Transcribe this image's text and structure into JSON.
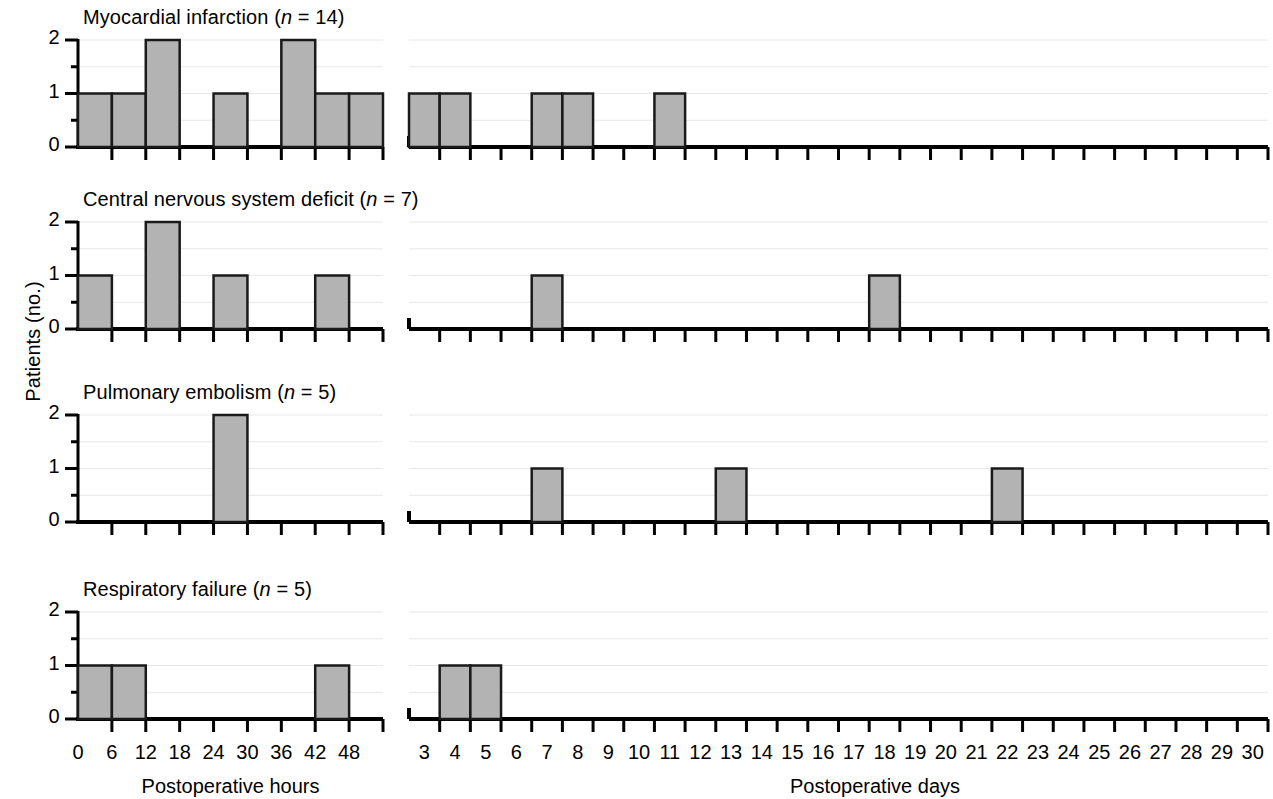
{
  "figure": {
    "ylabel": "Patients (no.)",
    "xlabel_left": "Postoperative hours",
    "xlabel_right": "Postoperative days",
    "bar_fill": "#b3b3b3",
    "bar_stroke": "#1a1a1a",
    "axis_color": "#000000",
    "grid_color": "#e8e8e8",
    "y_ticklabels": [
      "0",
      "1",
      "2"
    ],
    "hours_ticklabels": [
      "0",
      "6",
      "12",
      "18",
      "24",
      "30",
      "36",
      "42",
      "48"
    ],
    "days_ticklabels": [
      "3",
      "4",
      "5",
      "6",
      "7",
      "8",
      "9",
      "10",
      "11",
      "12",
      "13",
      "14",
      "15",
      "16",
      "17",
      "18",
      "19",
      "20",
      "21",
      "22",
      "23",
      "24",
      "25",
      "26",
      "27",
      "28",
      "29",
      "30"
    ]
  },
  "chart_data": {
    "type": "bar",
    "title": "",
    "ylabel": "Patients (no.)",
    "ylim": [
      0,
      2
    ],
    "yticks": [
      0,
      1,
      2
    ],
    "grid": true,
    "legend": "none",
    "layout": "4 stacked panels, each with a left histogram (postoperative hours) and a right histogram (postoperative days)",
    "panels": [
      {
        "title": "Myocardial infarction (n = 14)",
        "title_text": "Myocardial infarction",
        "n": 14,
        "hours": {
          "xlabel": "Postoperative hours",
          "bin_width": 6,
          "xlim": [
            0,
            54
          ],
          "xticks": [
            0,
            6,
            12,
            18,
            24,
            30,
            36,
            42,
            48
          ],
          "bins": [
            "0-6",
            "6-12",
            "12-18",
            "18-24",
            "24-30",
            "30-36",
            "36-42",
            "42-48",
            "48-54"
          ],
          "values": [
            1,
            1,
            2,
            0,
            1,
            0,
            2,
            1,
            1
          ]
        },
        "days": {
          "xlabel": "Postoperative days",
          "bin_width": 1,
          "xlim": [
            3,
            31
          ],
          "categories": [
            3,
            4,
            5,
            6,
            7,
            8,
            9,
            10,
            11,
            12,
            13,
            14,
            15,
            16,
            17,
            18,
            19,
            20,
            21,
            22,
            23,
            24,
            25,
            26,
            27,
            28,
            29,
            30
          ],
          "values": [
            1,
            1,
            0,
            0,
            1,
            1,
            0,
            0,
            1,
            0,
            0,
            0,
            0,
            0,
            0,
            0,
            0,
            0,
            0,
            0,
            0,
            0,
            0,
            0,
            0,
            0,
            0,
            0
          ]
        }
      },
      {
        "title": "Central nervous system deficit (n = 7)",
        "title_text": "Central nervous system deficit",
        "n": 7,
        "hours": {
          "xlabel": "Postoperative hours",
          "bin_width": 6,
          "xlim": [
            0,
            54
          ],
          "xticks": [
            0,
            6,
            12,
            18,
            24,
            30,
            36,
            42,
            48
          ],
          "bins": [
            "0-6",
            "6-12",
            "12-18",
            "18-24",
            "24-30",
            "30-36",
            "36-42",
            "42-48",
            "48-54"
          ],
          "values": [
            1,
            0,
            2,
            0,
            1,
            0,
            0,
            1,
            0
          ]
        },
        "days": {
          "xlabel": "Postoperative days",
          "bin_width": 1,
          "xlim": [
            3,
            31
          ],
          "categories": [
            3,
            4,
            5,
            6,
            7,
            8,
            9,
            10,
            11,
            12,
            13,
            14,
            15,
            16,
            17,
            18,
            19,
            20,
            21,
            22,
            23,
            24,
            25,
            26,
            27,
            28,
            29,
            30
          ],
          "values": [
            0,
            0,
            0,
            0,
            1,
            0,
            0,
            0,
            0,
            0,
            0,
            0,
            0,
            0,
            0,
            1,
            0,
            0,
            0,
            0,
            0,
            0,
            0,
            0,
            0,
            0,
            0,
            0
          ]
        }
      },
      {
        "title": "Pulmonary embolism (n = 5)",
        "title_text": "Pulmonary embolism",
        "n": 5,
        "hours": {
          "xlabel": "Postoperative hours",
          "bin_width": 6,
          "xlim": [
            0,
            54
          ],
          "xticks": [
            0,
            6,
            12,
            18,
            24,
            30,
            36,
            42,
            48
          ],
          "bins": [
            "0-6",
            "6-12",
            "12-18",
            "18-24",
            "24-30",
            "30-36",
            "36-42",
            "42-48",
            "48-54"
          ],
          "values": [
            0,
            0,
            0,
            0,
            2,
            0,
            0,
            0,
            0
          ]
        },
        "days": {
          "xlabel": "Postoperative days",
          "bin_width": 1,
          "xlim": [
            3,
            31
          ],
          "categories": [
            3,
            4,
            5,
            6,
            7,
            8,
            9,
            10,
            11,
            12,
            13,
            14,
            15,
            16,
            17,
            18,
            19,
            20,
            21,
            22,
            23,
            24,
            25,
            26,
            27,
            28,
            29,
            30
          ],
          "values": [
            0,
            0,
            0,
            0,
            1,
            0,
            0,
            0,
            0,
            0,
            1,
            0,
            0,
            0,
            0,
            0,
            0,
            0,
            0,
            1,
            0,
            0,
            0,
            0,
            0,
            0,
            0,
            0
          ]
        }
      },
      {
        "title": "Respiratory failure (n = 5)",
        "title_text": "Respiratory failure",
        "n": 5,
        "hours": {
          "xlabel": "Postoperative hours",
          "bin_width": 6,
          "xlim": [
            0,
            54
          ],
          "xticks": [
            0,
            6,
            12,
            18,
            24,
            30,
            36,
            42,
            48
          ],
          "bins": [
            "0-6",
            "6-12",
            "12-18",
            "18-24",
            "24-30",
            "30-36",
            "36-42",
            "42-48",
            "48-54"
          ],
          "values": [
            1,
            1,
            0,
            0,
            0,
            0,
            0,
            1,
            0
          ]
        },
        "days": {
          "xlabel": "Postoperative days",
          "bin_width": 1,
          "xlim": [
            3,
            31
          ],
          "categories": [
            3,
            4,
            5,
            6,
            7,
            8,
            9,
            10,
            11,
            12,
            13,
            14,
            15,
            16,
            17,
            18,
            19,
            20,
            21,
            22,
            23,
            24,
            25,
            26,
            27,
            28,
            29,
            30
          ],
          "values": [
            0,
            1,
            1,
            0,
            0,
            0,
            0,
            0,
            0,
            0,
            0,
            0,
            0,
            0,
            0,
            0,
            0,
            0,
            0,
            0,
            0,
            0,
            0,
            0,
            0,
            0,
            0,
            0
          ]
        }
      }
    ]
  }
}
